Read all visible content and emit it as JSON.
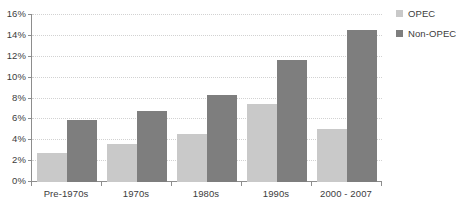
{
  "chart_data": {
    "type": "bar",
    "title": "",
    "xlabel": "",
    "ylabel": "",
    "categories": [
      "Pre-1970s",
      "1970s",
      "1980s",
      "1990s",
      "2000 - 2007"
    ],
    "series": [
      {
        "name": "OPEC",
        "color": "#c9c9c9",
        "values": [
          2.8,
          3.6,
          4.6,
          7.5,
          5.1
        ]
      },
      {
        "name": "Non-OPEC",
        "color": "#7e7e7e",
        "values": [
          5.9,
          6.8,
          8.3,
          11.7,
          14.6
        ]
      }
    ],
    "ylim": [
      0,
      16
    ],
    "ytick_values": [
      0,
      2,
      4,
      6,
      8,
      10,
      12,
      14,
      16
    ],
    "ytick_labels": [
      "0%",
      "2%",
      "4%",
      "6%",
      "8%",
      "10%",
      "12%",
      "14%",
      "16%"
    ],
    "grid": true,
    "legend_position": "right-top",
    "value_unit": "%"
  },
  "legend": {
    "entries": [
      {
        "label": "OPEC",
        "color": "#c9c9c9"
      },
      {
        "label": "Non-OPEC",
        "color": "#7e7e7e"
      }
    ]
  },
  "caption": {
    "text": ""
  },
  "colors": {
    "opec": "#c9c9c9",
    "non_opec": "#7e7e7e",
    "axis": "#8d8d8d",
    "gridline": "#d2d2d2",
    "text": "#3c3c3c",
    "background": "#ffffff"
  }
}
